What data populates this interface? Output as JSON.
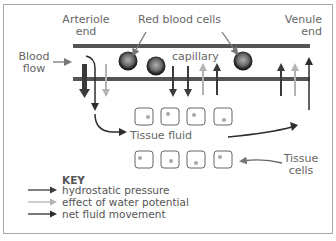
{
  "diagram": {
    "labels": {
      "arteriole_end": "Arteriole\nend",
      "arteriole_line1": "Arteriole",
      "arteriole_line2": "end",
      "red_blood_cells": "Red blood cells",
      "venule_line1": "Venule",
      "venule_line2": "end",
      "blood_flow_line1": "Blood",
      "blood_flow_line2": "flow",
      "capillary": "capillary",
      "tissue_fluid": "Tissue fluid",
      "tissue_cells_line1": "Tissue",
      "tissue_cells_line2": "cells"
    },
    "key": {
      "title": "KEY",
      "items": [
        {
          "label": "hydrostatic pressure",
          "color": "#3a3a3a"
        },
        {
          "label": "effect of water potential",
          "color": "#b3b3b3"
        },
        {
          "label": "net fluid movement",
          "color": "#2e2e2e"
        }
      ]
    },
    "colors": {
      "vessel_wall": "#555555",
      "hydrostatic": "#3a3a3a",
      "water_potential": "#b3b3b3",
      "net_movement": "#2e2e2e",
      "cell_border": "#666666",
      "cell_nucleus": "#a8a8a8",
      "text": "#666666",
      "frame": "#a9a9a9"
    },
    "red_blood_cell_count": 3,
    "tissue_cell_rows": [
      4,
      4
    ]
  }
}
